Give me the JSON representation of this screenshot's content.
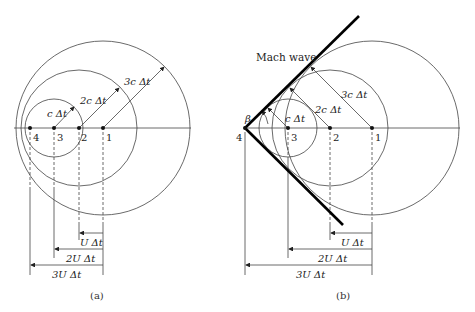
{
  "panels": [
    {
      "caption": "(a)",
      "points": [
        "1",
        "2",
        "3",
        "4"
      ],
      "radius_labels": [
        "c Δt",
        "2c Δt",
        "3c Δt"
      ],
      "dimension_labels": [
        "U Δt",
        "2U Δt",
        "3U Δt"
      ]
    },
    {
      "caption": "(b)",
      "points": [
        "1",
        "2",
        "3",
        "4"
      ],
      "radius_labels": [
        "c Δt",
        "2c Δt",
        "3c Δt"
      ],
      "dimension_labels": [
        "U Δt",
        "2U Δt",
        "3U Δt"
      ],
      "mach_label": "Mach wave",
      "angle_label": "β"
    }
  ]
}
